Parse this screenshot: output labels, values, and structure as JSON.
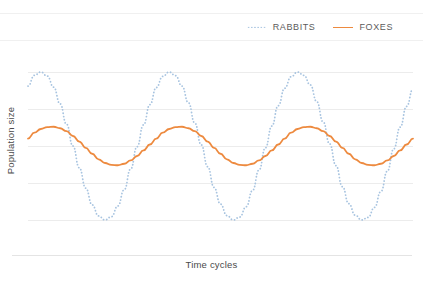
{
  "chart_data": {
    "type": "line",
    "title": "",
    "subtitle": "",
    "xlabel": "Time cycles",
    "ylabel": "Population size",
    "grid": true,
    "legend_position": "top-right",
    "xlim": [
      0,
      3
    ],
    "ylim": [
      0,
      4
    ],
    "x_tick_labels": [],
    "y_tick_labels": [],
    "gridline_values": [
      4,
      3,
      2,
      1,
      0
    ],
    "x": [
      0.0,
      0.05,
      0.1,
      0.15,
      0.2,
      0.25,
      0.3,
      0.35,
      0.4,
      0.45,
      0.5,
      0.55,
      0.6,
      0.65,
      0.7,
      0.75,
      0.8,
      0.85,
      0.9,
      0.95,
      1.0,
      1.05,
      1.1,
      1.15,
      1.2,
      1.25,
      1.3,
      1.35,
      1.4,
      1.45,
      1.5,
      1.55,
      1.6,
      1.65,
      1.7,
      1.75,
      1.8,
      1.85,
      1.9,
      1.95,
      2.0,
      2.05,
      2.1,
      2.15,
      2.2,
      2.25,
      2.3,
      2.35,
      2.4,
      2.45,
      2.5,
      2.55,
      2.6,
      2.65,
      2.7,
      2.75,
      2.8,
      2.85,
      2.9,
      2.95,
      3.0
    ],
    "series": [
      {
        "name": "RABBITS",
        "style": "dotted",
        "color": "#a8c4e0",
        "amplitude": 2.0,
        "midline": 2.0,
        "period_cycles": 1.0,
        "phase_peak_x": 0.2,
        "peaks_x": [
          0.2,
          1.2,
          2.2
        ],
        "troughs_x": [
          0.7,
          1.7,
          2.7
        ],
        "peak_value": 4.0,
        "trough_value": 0.0,
        "values": [
          3.62,
          3.91,
          4.0,
          3.89,
          3.59,
          3.14,
          2.59,
          2.0,
          1.41,
          0.86,
          0.41,
          0.11,
          0.0,
          0.09,
          0.38,
          0.82,
          1.38,
          1.98,
          2.57,
          3.12,
          3.58,
          3.88,
          4.0,
          3.9,
          3.62,
          3.17,
          2.62,
          2.03,
          1.44,
          0.88,
          0.43,
          0.12,
          0.0,
          0.08,
          0.36,
          0.8,
          1.35,
          1.95,
          2.54,
          3.09,
          3.56,
          3.87,
          4.0,
          3.91,
          3.65,
          3.2,
          2.65,
          2.06,
          1.47,
          0.9,
          0.44,
          0.13,
          0.0,
          0.07,
          0.34,
          0.77,
          1.32,
          1.92,
          2.51,
          3.07,
          3.54
        ]
      },
      {
        "name": "FOXES",
        "style": "solid",
        "color": "#ed8a3f",
        "amplitude": 0.52,
        "midline": 2.0,
        "period_cycles": 1.0,
        "phase_peak_x": 0.33,
        "peaks_x": [
          0.33,
          1.33,
          2.33
        ],
        "troughs_x": [
          0.83,
          1.83,
          2.83
        ],
        "peak_value": 2.52,
        "trough_value": 1.48,
        "values": [
          2.2,
          2.36,
          2.46,
          2.51,
          2.52,
          2.48,
          2.4,
          2.27,
          2.12,
          1.95,
          1.79,
          1.64,
          1.54,
          1.49,
          1.48,
          1.52,
          1.61,
          1.73,
          1.88,
          2.04,
          2.2,
          2.36,
          2.46,
          2.51,
          2.52,
          2.48,
          2.4,
          2.27,
          2.12,
          1.95,
          1.79,
          1.64,
          1.54,
          1.49,
          1.48,
          1.52,
          1.61,
          1.73,
          1.88,
          2.04,
          2.2,
          2.36,
          2.46,
          2.51,
          2.52,
          2.48,
          2.4,
          2.27,
          2.12,
          1.95,
          1.79,
          1.64,
          1.54,
          1.49,
          1.48,
          1.52,
          1.61,
          1.73,
          1.88,
          2.04,
          2.2
        ]
      }
    ],
    "annotations": []
  },
  "legend": {
    "items": [
      {
        "label": "RABBITS",
        "marker": "dotted-line-swatch",
        "color": "#a8c4e0"
      },
      {
        "label": "FOXES",
        "marker": "solid-line-swatch",
        "color": "#ed8a3f"
      }
    ]
  },
  "axes": {
    "y_title": "Population size",
    "x_title": "Time cycles"
  },
  "colors": {
    "rabbits": "#a8c4e0",
    "foxes": "#ed8a3f",
    "gridline": "#ececec",
    "text": "#4a4a4a",
    "background": "#ffffff"
  }
}
